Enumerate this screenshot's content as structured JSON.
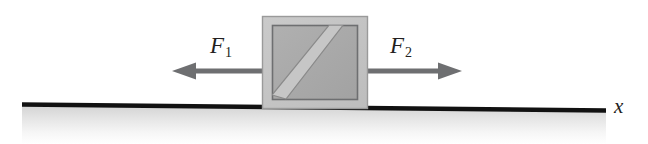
{
  "figure": {
    "name": "block-on-surface-two-forces",
    "width": 648,
    "height": 144,
    "background_color": "#ffffff"
  },
  "labels": {
    "force_left": {
      "symbol": "F",
      "subscript": "1",
      "text": "F1"
    },
    "force_right": {
      "symbol": "F",
      "subscript": "2",
      "text": "F2"
    },
    "axis_x": "x"
  },
  "arrows": {
    "left": {
      "name": "force-arrow-left",
      "direction": "left",
      "tail_x": 262,
      "tip_x": 172,
      "y": 71,
      "shaft_thickness": 5,
      "head_length": 22,
      "head_width": 17,
      "color": "#6e6f71"
    },
    "right": {
      "name": "force-arrow-right",
      "direction": "right",
      "tail_x": 368,
      "tip_x": 462,
      "y": 71,
      "shaft_thickness": 5,
      "head_length": 22,
      "head_width": 17,
      "color": "#6e6f71"
    }
  },
  "block": {
    "name": "block",
    "outer": {
      "x": 262,
      "y": 16,
      "width": 106,
      "height": 93
    },
    "inner": {
      "x": 272,
      "y": 25,
      "width": 86,
      "height": 75
    },
    "outer_fill": "#c3c3c3",
    "outer_stroke": "#8e8e8e",
    "inner_fill": "#a9a9a9",
    "inner_stroke": "#6e6f71",
    "diagonal_band": {
      "name": "diagonal-stripe",
      "fill": "#c9c9c9",
      "stroke": "#8a8a8a",
      "orientation": "bottom-left-to-top-right",
      "width": 14
    }
  },
  "ground": {
    "name": "ground-surface",
    "line_color": "#111111",
    "line_thickness": 4,
    "x_start": 22,
    "x_end": 606,
    "y_start": 104,
    "y_end": 110,
    "shading_top_color": "#d8d8d8",
    "shading_bottom_color": "#ffffff",
    "shading_height": 34
  },
  "colors": {
    "arrow_gray": "#6e6f71",
    "block_light": "#c3c3c3",
    "block_mid": "#a9a9a9",
    "stripe": "#c9c9c9",
    "ink": "#231f20"
  }
}
